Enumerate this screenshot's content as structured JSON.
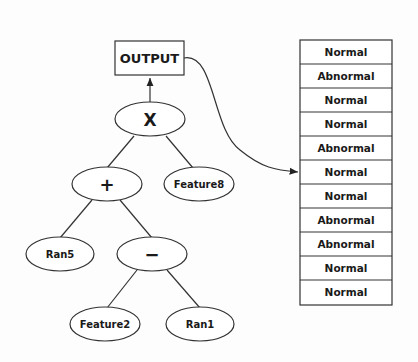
{
  "tree": {
    "output_label": "OUTPUT",
    "nodes": [
      {
        "id": "x",
        "label": "X"
      },
      {
        "id": "plus",
        "label": "+"
      },
      {
        "id": "feature8",
        "label": "Feature8"
      },
      {
        "id": "ran5",
        "label": "Ran5"
      },
      {
        "id": "minus",
        "label": "−"
      },
      {
        "id": "feature2",
        "label": "Feature2"
      },
      {
        "id": "ran1",
        "label": "Ran1"
      }
    ]
  },
  "output_column": {
    "rows": [
      "Normal",
      "Abnormal",
      "Normal",
      "Normal",
      "Abnormal",
      "Normal",
      "Normal",
      "Abnormal",
      "Abnormal",
      "Normal",
      "Normal"
    ]
  },
  "colors": {
    "stroke": "#333333",
    "background": "#fdfdfd",
    "text": "#1a1a1a"
  }
}
